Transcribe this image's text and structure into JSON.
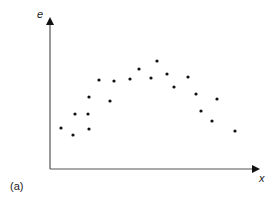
{
  "chart_data": {
    "type": "scatter",
    "title": "",
    "xlabel": "x",
    "ylabel": "e",
    "panel_label": "(a)",
    "grid": false,
    "legend": null,
    "axis_ticks": false,
    "pixel_frame": {
      "origin": [
        50,
        169
      ],
      "x_end": 263,
      "y_end": 14
    },
    "points_pixel": [
      [
        61,
        128
      ],
      [
        73,
        135
      ],
      [
        75,
        114
      ],
      [
        88,
        114
      ],
      [
        89,
        129
      ],
      [
        89,
        97
      ],
      [
        99,
        80
      ],
      [
        110,
        101
      ],
      [
        114,
        81
      ],
      [
        130,
        79
      ],
      [
        139,
        69
      ],
      [
        151,
        78
      ],
      [
        157,
        61
      ],
      [
        167,
        74
      ],
      [
        174,
        87
      ],
      [
        188,
        77
      ],
      [
        196,
        94
      ],
      [
        201,
        111
      ],
      [
        212,
        121
      ],
      [
        217,
        99
      ],
      [
        235,
        131
      ]
    ],
    "x": [
      0.05,
      0.11,
      0.12,
      0.18,
      0.18,
      0.18,
      0.23,
      0.28,
      0.3,
      0.38,
      0.42,
      0.477,
      0.5,
      0.55,
      0.58,
      0.65,
      0.69,
      0.71,
      0.76,
      0.79,
      0.87
    ],
    "y": [
      0.26,
      0.22,
      0.35,
      0.35,
      0.26,
      0.46,
      0.57,
      0.44,
      0.57,
      0.58,
      0.65,
      0.59,
      0.7,
      0.61,
      0.53,
      0.59,
      0.48,
      0.37,
      0.31,
      0.45,
      0.25
    ],
    "xlim": [
      0,
      1
    ],
    "ylim": [
      0,
      1
    ]
  }
}
